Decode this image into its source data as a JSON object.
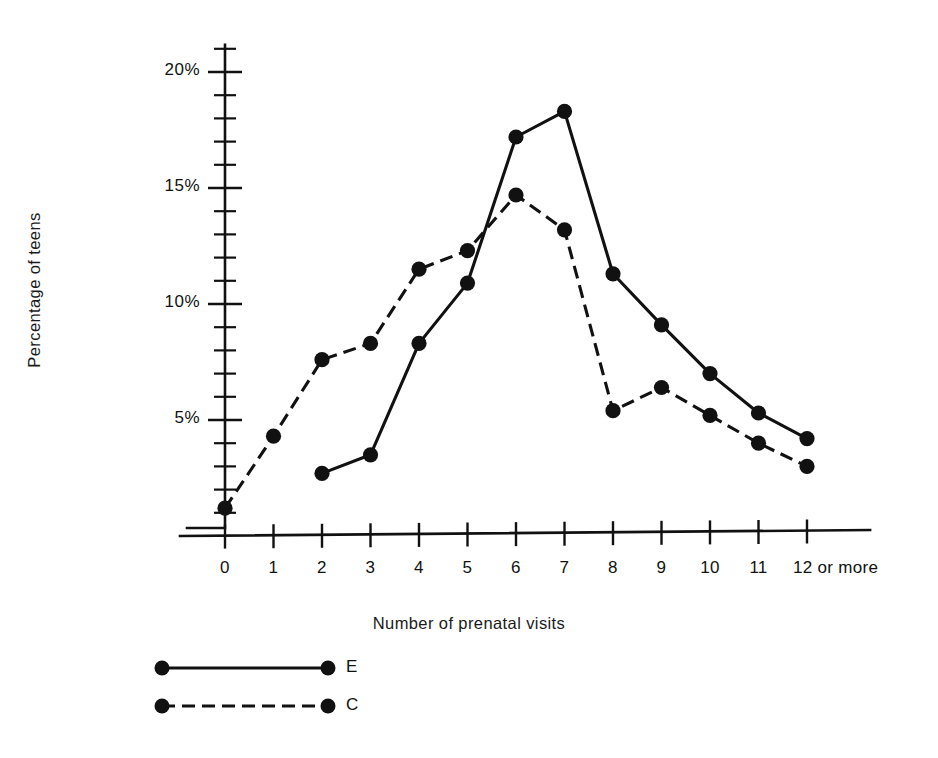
{
  "chart_data": {
    "type": "line",
    "title": "",
    "xlabel": "Number of prenatal visits",
    "ylabel": "Percentage of teens",
    "categories": [
      "0",
      "1",
      "2",
      "3",
      "4",
      "5",
      "6",
      "7",
      "8",
      "9",
      "10",
      "11",
      "12 or more"
    ],
    "x": [
      0,
      1,
      2,
      3,
      4,
      5,
      6,
      7,
      8,
      9,
      10,
      11,
      12
    ],
    "xtick_labels": [
      "0",
      "1",
      "2",
      "3",
      "4",
      "5",
      "6",
      "7",
      "8",
      "9",
      "10",
      "11",
      "12 or more"
    ],
    "ytick_labels": [
      "5%",
      "10%",
      "15%",
      "20%"
    ],
    "ytick_values": [
      5,
      10,
      15,
      20
    ],
    "yminor_step": 1,
    "ylim": [
      0,
      21
    ],
    "xlim": [
      -0.45,
      13.2
    ],
    "grid": false,
    "legend_position": "below-left",
    "series": [
      {
        "name": "E",
        "style": "solid",
        "marker": "filled-circle",
        "x": [
          2,
          3,
          4,
          5,
          6,
          7,
          8,
          9,
          10,
          11,
          12
        ],
        "values": [
          2.7,
          3.5,
          8.3,
          10.9,
          17.2,
          18.3,
          11.3,
          9.1,
          7.0,
          5.3,
          4.2
        ]
      },
      {
        "name": "C",
        "style": "dashed",
        "marker": "filled-circle",
        "x": [
          0,
          1,
          2,
          3,
          4,
          5,
          6,
          7,
          8,
          9,
          10,
          11,
          12
        ],
        "values": [
          1.2,
          4.3,
          7.6,
          8.3,
          11.5,
          12.3,
          14.7,
          13.2,
          5.4,
          6.4,
          5.2,
          4.0,
          3.0
        ]
      }
    ],
    "colors": {
      "ink": "#111111",
      "background": "#ffffff"
    }
  },
  "legend": {
    "entries": [
      {
        "label": "E",
        "style": "solid"
      },
      {
        "label": "C",
        "style": "dashed"
      }
    ]
  }
}
